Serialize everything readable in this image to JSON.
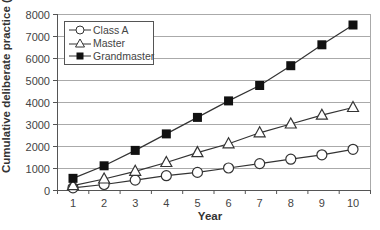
{
  "chart_data": {
    "type": "line",
    "title": "",
    "xlabel": "Year",
    "ylabel": "Cumulative deliberate practice (h)",
    "x": [
      1,
      2,
      3,
      4,
      5,
      6,
      7,
      8,
      9,
      10
    ],
    "xticks": [
      "1",
      "2",
      "3",
      "4",
      "5",
      "6",
      "7",
      "8",
      "9",
      "10"
    ],
    "yticks": [
      "0",
      "1000",
      "2000",
      "3000",
      "4000",
      "5000",
      "6000",
      "7000",
      "8000"
    ],
    "ylim": [
      0,
      8000
    ],
    "grid": "horizontal",
    "legend_position": "upper-left",
    "series": [
      {
        "name": "Class A",
        "marker": "open-circle",
        "values": [
          100,
          250,
          450,
          650,
          800,
          1000,
          1200,
          1400,
          1600,
          1850
        ]
      },
      {
        "name": "Master",
        "marker": "open-triangle",
        "values": [
          200,
          500,
          850,
          1250,
          1700,
          2100,
          2600,
          3000,
          3400,
          3750
        ]
      },
      {
        "name": "Grandmaster",
        "marker": "filled-square",
        "values": [
          530,
          1100,
          1800,
          2550,
          3300,
          4050,
          4750,
          5650,
          6600,
          7500
        ]
      }
    ]
  },
  "legend": {
    "items": [
      {
        "label": "Class A"
      },
      {
        "label": "Master"
      },
      {
        "label": "Grandmaster"
      }
    ]
  },
  "colors": {
    "line": "#333333",
    "grid": "#aaaaaa",
    "marker_fill_filled": "#111111",
    "marker_fill_open": "#ffffff"
  }
}
